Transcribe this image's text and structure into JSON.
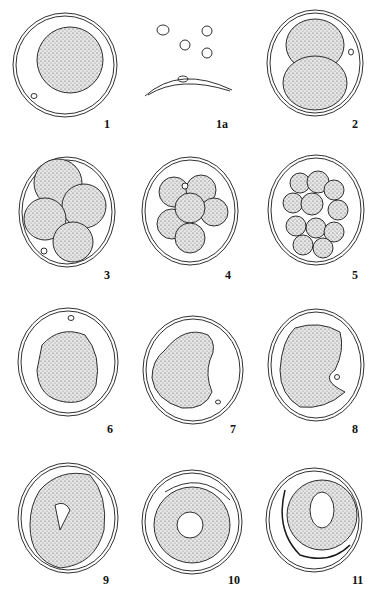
{
  "plate": {
    "figures": [
      {
        "label": "1",
        "x": 104,
        "y": 117
      },
      {
        "label": "1a",
        "x": 216,
        "y": 117
      },
      {
        "label": "2",
        "x": 352,
        "y": 117
      },
      {
        "label": "3",
        "x": 104,
        "y": 268
      },
      {
        "label": "4",
        "x": 225,
        "y": 268
      },
      {
        "label": "5",
        "x": 352,
        "y": 268
      },
      {
        "label": "6",
        "x": 107,
        "y": 422
      },
      {
        "label": "7",
        "x": 230,
        "y": 422
      },
      {
        "label": "8",
        "x": 352,
        "y": 422
      },
      {
        "label": "9",
        "x": 103,
        "y": 573
      },
      {
        "label": "10",
        "x": 228,
        "y": 573
      },
      {
        "label": "11",
        "x": 352,
        "y": 573
      }
    ],
    "colors": {
      "ink": "#1a1a1a",
      "fill": "#cfcfcf",
      "paper": "#ffffff"
    }
  }
}
